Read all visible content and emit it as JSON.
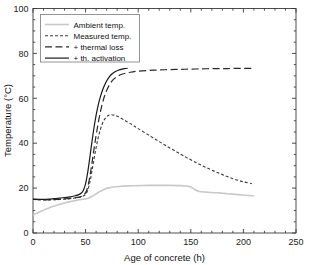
{
  "chart_data": {
    "type": "line",
    "title": "",
    "xlabel": "Age of concrete (h)",
    "ylabel": "Temperature (°C)",
    "xlim": [
      0,
      250
    ],
    "ylim": [
      0,
      100
    ],
    "xticks": [
      0,
      50,
      100,
      150,
      200,
      250
    ],
    "yticks": [
      0,
      20,
      40,
      60,
      80,
      100
    ],
    "xtick_labels": [
      "0",
      "50",
      "100",
      "150",
      "200",
      "250"
    ],
    "ytick_labels": [
      "0",
      "20",
      "40",
      "60",
      "80",
      "100"
    ],
    "grid": false,
    "legend_position": "upper left",
    "series": [
      {
        "name": "Ambient temp.",
        "style": "solid",
        "color": "#c9c9c9",
        "width": 1.6,
        "x": [
          0,
          4,
          8,
          12,
          16,
          20,
          24,
          28,
          32,
          36,
          40,
          44,
          47,
          50,
          53,
          56,
          60,
          64,
          68,
          72,
          78,
          84,
          90,
          100,
          110,
          120,
          130,
          140,
          146,
          150,
          154,
          158,
          165,
          175,
          185,
          195,
          205,
          210
        ],
        "y": [
          8.0,
          8.9,
          9.8,
          10.6,
          11.3,
          12.0,
          12.6,
          13.1,
          13.6,
          14.0,
          14.4,
          14.8,
          15.0,
          15.2,
          15.6,
          16.3,
          17.4,
          18.6,
          19.5,
          20.1,
          20.6,
          20.8,
          21.0,
          21.1,
          21.2,
          21.2,
          21.2,
          21.1,
          20.9,
          20.5,
          19.3,
          18.5,
          18.2,
          17.9,
          17.5,
          17.1,
          16.7,
          16.5
        ]
      },
      {
        "name": "Measured temp.",
        "style": "dashed-short",
        "color": "#3a3a3a",
        "width": 1.1,
        "x": [
          0,
          5,
          10,
          15,
          20,
          25,
          30,
          35,
          40,
          44,
          47,
          50,
          52,
          54,
          56,
          58,
          60,
          62,
          64,
          66,
          68,
          70,
          72,
          74,
          77,
          80,
          85,
          90,
          95,
          100,
          110,
          120,
          130,
          140,
          150,
          160,
          170,
          180,
          190,
          200,
          208
        ],
        "y": [
          15.0,
          14.8,
          14.7,
          14.7,
          14.8,
          14.9,
          15.1,
          15.3,
          15.6,
          15.9,
          16.3,
          17.2,
          19.0,
          22.5,
          27.5,
          33.0,
          38.0,
          42.5,
          46.0,
          48.8,
          50.6,
          51.8,
          52.5,
          52.7,
          52.5,
          52.0,
          50.8,
          49.4,
          48.0,
          46.5,
          43.6,
          40.7,
          37.9,
          35.2,
          32.6,
          30.2,
          28.0,
          26.0,
          24.2,
          22.8,
          22.0
        ]
      },
      {
        "name": "+ thermal loss",
        "style": "dashed-long",
        "color": "#2a2a2a",
        "width": 1.2,
        "x": [
          0,
          5,
          10,
          15,
          20,
          25,
          30,
          35,
          40,
          44,
          47,
          50,
          52,
          54,
          56,
          58,
          60,
          62,
          64,
          66,
          68,
          70,
          73,
          76,
          80,
          85,
          90,
          95,
          100,
          110,
          120,
          130,
          140,
          150,
          160,
          170,
          180,
          190,
          200,
          208
        ],
        "y": [
          15.0,
          14.9,
          14.8,
          14.8,
          14.9,
          15.0,
          15.2,
          15.4,
          15.7,
          16.0,
          16.5,
          18.0,
          20.5,
          25.0,
          31.0,
          37.5,
          43.5,
          49.0,
          53.8,
          57.8,
          61.0,
          63.5,
          66.3,
          68.2,
          69.7,
          70.8,
          71.4,
          71.8,
          72.1,
          72.4,
          72.6,
          72.8,
          72.9,
          73.0,
          73.1,
          73.2,
          73.2,
          73.3,
          73.3,
          73.3
        ]
      },
      {
        "name": "+ th. activation",
        "style": "solid",
        "color": "#1a1a1a",
        "width": 1.2,
        "x": [
          0,
          5,
          10,
          15,
          20,
          25,
          30,
          35,
          40,
          43,
          46,
          48,
          50,
          52,
          54,
          56,
          58,
          60,
          62,
          64,
          66,
          68,
          70,
          72,
          75,
          78,
          81,
          84,
          87,
          90
        ],
        "y": [
          15.0,
          15.0,
          15.0,
          15.1,
          15.3,
          15.5,
          15.8,
          16.1,
          16.6,
          17.0,
          17.8,
          19.2,
          22.0,
          27.0,
          33.5,
          40.5,
          47.0,
          52.5,
          57.0,
          60.6,
          63.5,
          65.8,
          67.7,
          69.2,
          70.8,
          71.8,
          72.5,
          72.9,
          73.2,
          73.4
        ]
      }
    ]
  },
  "legend": {
    "entries": [
      {
        "label": "Ambient temp."
      },
      {
        "label": "Measured temp."
      },
      {
        "label": "+ thermal loss"
      },
      {
        "label": "+ th. activation"
      }
    ]
  }
}
